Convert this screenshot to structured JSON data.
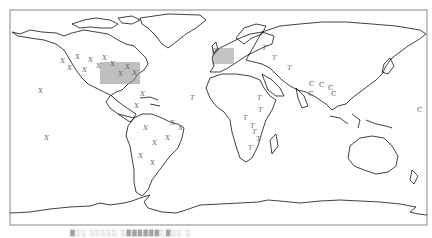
{
  "map": {
    "type": "world-outline",
    "projection": "equirectangular",
    "frame": {
      "x": 10,
      "y": 10,
      "w": 417,
      "h": 215
    },
    "colors": {
      "coastline": "#111111",
      "marker": "#666666",
      "dense_marker": "#777777",
      "frame": "#888888"
    },
    "markers": [
      {
        "symbol": "X",
        "x": 38,
        "y": 93
      },
      {
        "symbol": "X",
        "x": 44,
        "y": 140
      },
      {
        "symbol": "X",
        "x": 60,
        "y": 63
      },
      {
        "symbol": "X",
        "x": 67,
        "y": 70
      },
      {
        "symbol": "X",
        "x": 75,
        "y": 59
      },
      {
        "symbol": "X",
        "x": 82,
        "y": 72
      },
      {
        "symbol": "X",
        "x": 88,
        "y": 62
      },
      {
        "symbol": "X",
        "x": 96,
        "y": 68
      },
      {
        "symbol": "X",
        "x": 102,
        "y": 60
      },
      {
        "symbol": "X",
        "x": 110,
        "y": 66
      },
      {
        "symbol": "X",
        "x": 118,
        "y": 76
      },
      {
        "symbol": "X",
        "x": 125,
        "y": 69
      },
      {
        "symbol": "X",
        "x": 132,
        "y": 75
      },
      {
        "symbol": "X",
        "x": 140,
        "y": 96
      },
      {
        "symbol": "X",
        "x": 134,
        "y": 108
      },
      {
        "symbol": "X",
        "x": 143,
        "y": 130
      },
      {
        "symbol": "X",
        "x": 152,
        "y": 145
      },
      {
        "symbol": "X",
        "x": 165,
        "y": 140
      },
      {
        "symbol": "X",
        "x": 170,
        "y": 125
      },
      {
        "symbol": "X",
        "x": 178,
        "y": 130
      },
      {
        "symbol": "X",
        "x": 138,
        "y": 158
      },
      {
        "symbol": "X",
        "x": 150,
        "y": 165
      },
      {
        "symbol": "T",
        "x": 190,
        "y": 100
      },
      {
        "symbol": "T",
        "x": 257,
        "y": 100
      },
      {
        "symbol": "T",
        "x": 258,
        "y": 112
      },
      {
        "symbol": "T",
        "x": 250,
        "y": 128
      },
      {
        "symbol": "T",
        "x": 252,
        "y": 134
      },
      {
        "symbol": "T",
        "x": 256,
        "y": 141
      },
      {
        "symbol": "T",
        "x": 243,
        "y": 120
      },
      {
        "symbol": "T",
        "x": 262,
        "y": 50
      },
      {
        "symbol": "T",
        "x": 272,
        "y": 60
      },
      {
        "symbol": "T",
        "x": 287,
        "y": 70
      },
      {
        "symbol": "T",
        "x": 248,
        "y": 150
      },
      {
        "symbol": "C",
        "x": 309,
        "y": 86
      },
      {
        "symbol": "C",
        "x": 319,
        "y": 87
      },
      {
        "symbol": "C",
        "x": 328,
        "y": 90
      },
      {
        "symbol": "C",
        "x": 331,
        "y": 96
      },
      {
        "symbol": "C",
        "x": 308,
        "y": 96
      },
      {
        "symbol": "C",
        "x": 417,
        "y": 112
      }
    ],
    "caption": "▓░░ ░░░░░ ░▓▓▓▓▓▓░▓░░ ░"
  }
}
